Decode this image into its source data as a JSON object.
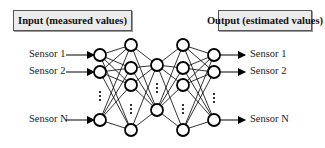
{
  "input_box": {
    "label": "Input (measured values)"
  },
  "output_box": {
    "label": "Output (estimated values)"
  },
  "inputs": [
    {
      "label": "Sensor 1",
      "y": 55
    },
    {
      "label": "Sensor 2",
      "y": 72
    },
    {
      "label": "Sensor N",
      "y": 120
    }
  ],
  "outputs": [
    {
      "label": "Sensor 1",
      "y": 55
    },
    {
      "label": "Sensor 2",
      "y": 72
    },
    {
      "label": "Sensor N",
      "y": 120
    }
  ],
  "network": {
    "node_radius": 6,
    "stroke_color": "#000000",
    "layers": [
      {
        "name": "input",
        "x": 100,
        "nodes": [
          55,
          72,
          120
        ],
        "ellipsis_y": 96
      },
      {
        "name": "hidden-1",
        "x": 131,
        "nodes": [
          45,
          68,
          85,
          130
        ],
        "ellipsis_y": 109
      },
      {
        "name": "hidden-2",
        "x": 157,
        "nodes": [
          65,
          110
        ],
        "ellipsis_y": 88
      },
      {
        "name": "hidden-3",
        "x": 183,
        "nodes": [
          45,
          68,
          85,
          130
        ],
        "ellipsis_y": 109
      },
      {
        "name": "output",
        "x": 214,
        "nodes": [
          55,
          72,
          120
        ],
        "ellipsis_y": 98
      }
    ]
  }
}
